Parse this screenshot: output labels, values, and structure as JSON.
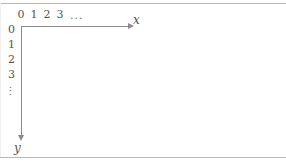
{
  "axes": {
    "x": {
      "name": "x",
      "direction": "right",
      "tick_labels": [
        "0",
        "1",
        "2",
        "3"
      ],
      "continuation": "..."
    },
    "y": {
      "name": "y",
      "direction": "down",
      "tick_labels": [
        "0",
        "1",
        "2",
        "3"
      ],
      "continuation": "⋮"
    }
  },
  "colors": {
    "axis": "#8c8c8c",
    "text": "#555555",
    "rule": "#b9b9b9",
    "background": "#ffffff"
  }
}
